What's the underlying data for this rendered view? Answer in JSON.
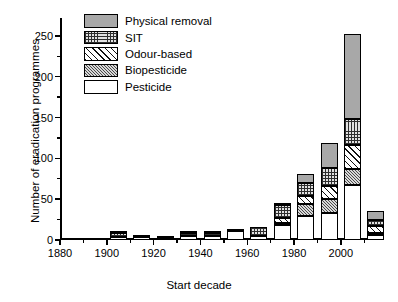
{
  "chart_data": {
    "type": "bar",
    "stacked": true,
    "title": "",
    "xlabel": "Start decade",
    "ylabel": "Number of eradication programmes",
    "categories": [
      "1880",
      "1890",
      "1900",
      "1910",
      "1920",
      "1930",
      "1940",
      "1950",
      "1960",
      "1970",
      "1980",
      "1990",
      "2000",
      "2010"
    ],
    "xlim": [
      1880,
      2018
    ],
    "ylim": [
      0,
      272
    ],
    "yticks": [
      0,
      50,
      100,
      150,
      200,
      250
    ],
    "yminor_step": 25,
    "xticks": [
      1880,
      1900,
      1920,
      1940,
      1960,
      1980,
      2000
    ],
    "xminor_step": 10,
    "grid": false,
    "legend_position": "top-left",
    "series": [
      {
        "name": "Pesticide",
        "pattern": "solid-white",
        "color": "#ffffff",
        "values": [
          1,
          1,
          4,
          4,
          2,
          5,
          5,
          11,
          5,
          19,
          29,
          33,
          68,
          6
        ]
      },
      {
        "name": "Biopesticide",
        "pattern": "fine-diagonal",
        "color": "#d8d8d8",
        "values": [
          0,
          0,
          0,
          0,
          0,
          0,
          0,
          0,
          0,
          2,
          15,
          17,
          19,
          2
        ]
      },
      {
        "name": "Odour-based",
        "pattern": "wide-diagonal",
        "color": "#ffffff",
        "values": [
          0,
          0,
          0,
          0,
          0,
          0,
          0,
          0,
          0,
          6,
          10,
          16,
          30,
          9
        ]
      },
      {
        "name": "SIT",
        "pattern": "cross-hatch",
        "color": "#e2e2e2",
        "values": [
          0,
          0,
          5,
          0,
          0,
          3,
          3,
          3,
          11,
          16,
          16,
          22,
          31,
          7
        ]
      },
      {
        "name": "Physical removal",
        "pattern": "solid-grey",
        "color": "#a8a8a8",
        "values": [
          0,
          0,
          1,
          1,
          1,
          1,
          1,
          0,
          0,
          2,
          11,
          31,
          105,
          11
        ]
      }
    ],
    "totals": [
      1,
      1,
      10,
      5,
      3,
      9,
      9,
      14,
      16,
      45,
      81,
      119,
      253,
      35
    ]
  },
  "legend": {
    "items": [
      {
        "label": "Physical removal"
      },
      {
        "label": "SIT"
      },
      {
        "label": "Odour-based"
      },
      {
        "label": "Biopesticide"
      },
      {
        "label": "Pesticide"
      }
    ]
  }
}
